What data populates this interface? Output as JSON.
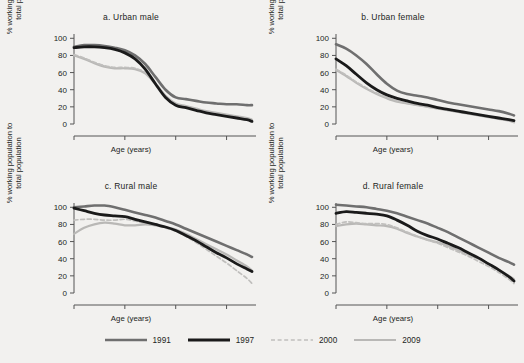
{
  "figure": {
    "background_color": "#f2f1ef",
    "width": 524,
    "height": 363
  },
  "legend": {
    "position": "bottom-center",
    "items": [
      {
        "label": "1991",
        "color": "#6f6f6f",
        "style": "solid",
        "width": 2.6
      },
      {
        "label": "1997",
        "color": "#1a1a1a",
        "style": "solid",
        "width": 2.8
      },
      {
        "label": "2000",
        "color": "#c0bfbd",
        "style": "dashed",
        "width": 1.7
      },
      {
        "label": "2009",
        "color": "#b9b8b6",
        "style": "solid",
        "width": 2.2
      }
    ]
  },
  "axes": {
    "xlabel": "Age (years)",
    "ylabel_line1": "% working population to",
    "ylabel_line2": "total population",
    "xticks": [
      45,
      55,
      65,
      75
    ],
    "yticks": [
      0,
      20,
      40,
      60,
      80,
      100
    ],
    "xlim": [
      45,
      80
    ],
    "ylim": [
      0,
      105
    ],
    "grid": false
  },
  "chart_data": {
    "type": "line",
    "xlabel": "Age (years)",
    "ylabel": "% working population to total population",
    "xlim": [
      45,
      80
    ],
    "ylim": [
      0,
      105
    ],
    "xticks": [
      45,
      55,
      65,
      75
    ],
    "yticks": [
      0,
      20,
      40,
      60,
      80,
      100
    ],
    "grid": false,
    "legend_position": "bottom-center",
    "x": [
      45,
      47,
      49,
      51,
      53,
      55,
      57,
      59,
      61,
      63,
      65,
      67,
      69,
      71,
      73,
      75,
      77,
      79,
      80
    ],
    "panels": [
      {
        "key": "a",
        "title": "a.  Urban male",
        "series": [
          {
            "name": "1991",
            "color": "#6f6f6f",
            "style": "solid",
            "values": [
              90,
              92,
              92,
              91,
              89,
              86,
              80,
              70,
              55,
              40,
              31,
              29,
              27,
              25,
              24,
              23,
              23,
              22,
              22
            ]
          },
          {
            "name": "1997",
            "color": "#1a1a1a",
            "style": "solid",
            "values": [
              89,
              90,
              90,
              89,
              87,
              83,
              76,
              64,
              47,
              31,
              22,
              19,
              16,
              13,
              11,
              9,
              7,
              5,
              3
            ]
          },
          {
            "name": "2000",
            "color": "#c0bfbd",
            "style": "dashed",
            "values": [
              81,
              77,
              72,
              68,
              66,
              66,
              65,
              60,
              48,
              33,
              23,
              20,
              17,
              14,
              12,
              10,
              8,
              6,
              5
            ]
          },
          {
            "name": "2009",
            "color": "#b9b8b6",
            "style": "solid",
            "values": [
              80,
              76,
              71,
              67,
              65,
              65,
              64,
              59,
              47,
              33,
              24,
              21,
              18,
              15,
              13,
              11,
              9,
              7,
              5
            ]
          }
        ]
      },
      {
        "key": "b",
        "title": "b.  Urban female",
        "series": [
          {
            "name": "1991",
            "color": "#6f6f6f",
            "style": "solid",
            "values": [
              93,
              88,
              80,
              70,
              58,
              47,
              39,
              35,
              33,
              31,
              28,
              25,
              23,
              21,
              19,
              17,
              15,
              12,
              10
            ]
          },
          {
            "name": "1997",
            "color": "#1a1a1a",
            "style": "solid",
            "values": [
              76,
              68,
              58,
              48,
              40,
              34,
              30,
              27,
              24,
              22,
              19,
              17,
              15,
              13,
              11,
              9,
              7,
              5,
              4
            ]
          },
          {
            "name": "2000",
            "color": "#c0bfbd",
            "style": "dashed",
            "values": [
              64,
              57,
              49,
              42,
              36,
              31,
              27,
              24,
              22,
              20,
              18,
              16,
              14,
              12,
              10,
              8,
              6,
              4,
              2
            ]
          },
          {
            "name": "2009",
            "color": "#b9b8b6",
            "style": "solid",
            "values": [
              63,
              56,
              48,
              41,
              35,
              30,
              26,
              24,
              22,
              20,
              18,
              16,
              14,
              12,
              10,
              8,
              6,
              4,
              2
            ]
          }
        ]
      },
      {
        "key": "c",
        "title": "c.  Rural male",
        "series": [
          {
            "name": "1991",
            "color": "#6f6f6f",
            "style": "solid",
            "values": [
              100,
              101,
              102,
              102,
              100,
              97,
              94,
              91,
              88,
              84,
              80,
              75,
              70,
              65,
              60,
              55,
              50,
              45,
              42
            ]
          },
          {
            "name": "1997",
            "color": "#1a1a1a",
            "style": "solid",
            "values": [
              99,
              96,
              93,
              91,
              90,
              89,
              86,
              83,
              80,
              77,
              73,
              67,
              61,
              54,
              47,
              41,
              34,
              28,
              25
            ]
          },
          {
            "name": "2000",
            "color": "#c0bfbd",
            "style": "dashed",
            "values": [
              85,
              86,
              86,
              85,
              85,
              86,
              84,
              81,
              79,
              76,
              72,
              66,
              59,
              51,
              43,
              35,
              26,
              17,
              11
            ]
          },
          {
            "name": "2009",
            "color": "#b9b8b6",
            "style": "solid",
            "values": [
              69,
              76,
              80,
              82,
              81,
              79,
              79,
              80,
              79,
              77,
              74,
              69,
              63,
              57,
              51,
              45,
              38,
              31,
              26
            ]
          }
        ]
      },
      {
        "key": "d",
        "title": "d.  Rural female",
        "series": [
          {
            "name": "1991",
            "color": "#6f6f6f",
            "style": "solid",
            "values": [
              103,
              102,
              101,
              100,
              98,
              96,
              93,
              89,
              85,
              81,
              76,
              71,
              65,
              59,
              53,
              47,
              41,
              36,
              33
            ]
          },
          {
            "name": "1997",
            "color": "#1a1a1a",
            "style": "solid",
            "values": [
              93,
              95,
              94,
              93,
              92,
              90,
              85,
              79,
              72,
              67,
              63,
              58,
              53,
              47,
              41,
              34,
              27,
              19,
              14
            ]
          },
          {
            "name": "2000",
            "color": "#c0bfbd",
            "style": "dashed",
            "values": [
              80,
              83,
              82,
              81,
              81,
              80,
              76,
              71,
              66,
              62,
              58,
              53,
              48,
              43,
              37,
              31,
              24,
              16,
              11
            ]
          },
          {
            "name": "2009",
            "color": "#b9b8b6",
            "style": "solid",
            "values": [
              78,
              80,
              81,
              80,
              79,
              78,
              75,
              70,
              66,
              62,
              59,
              55,
              50,
              45,
              40,
              34,
              27,
              20,
              16
            ]
          }
        ]
      }
    ]
  }
}
